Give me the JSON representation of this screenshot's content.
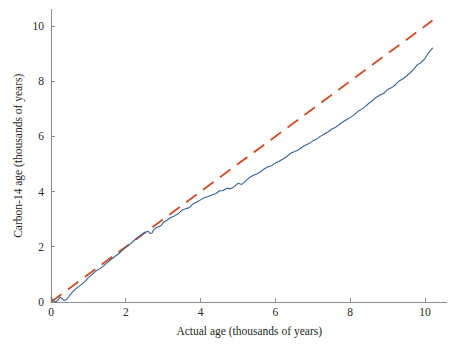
{
  "chart_data": {
    "type": "line",
    "title": "",
    "xlabel": "Actual age (thousands of years)",
    "ylabel": "Carbon-14 age (thousands of years)",
    "xlim": [
      0,
      10.6
    ],
    "ylim": [
      0,
      10.6
    ],
    "xticks": [
      0,
      2,
      4,
      6,
      8,
      10
    ],
    "yticks": [
      0,
      2,
      4,
      6,
      8,
      10
    ],
    "xtick_labels": [
      "0",
      "2",
      "4",
      "6",
      "8",
      "10"
    ],
    "ytick_labels": [
      "0",
      "2",
      "4",
      "6",
      "8",
      "10"
    ],
    "grid": false,
    "legend": "none",
    "series": [
      {
        "name": "One-to-one reference line",
        "style": "dashed",
        "color": "#d0502a",
        "linewidth": 1.9,
        "dash_pattern": "13,8",
        "x": [
          0,
          10.2
        ],
        "values": [
          0,
          10.2
        ]
      },
      {
        "name": "Carbon-14 calibration curve",
        "style": "solid",
        "color": "#36609a",
        "linewidth": 1.1,
        "x": [
          0,
          0.06,
          0.12,
          0.18,
          0.24,
          0.3,
          0.36,
          0.42,
          0.48,
          0.54,
          0.6,
          0.7,
          0.8,
          0.9,
          1.0,
          1.1,
          1.2,
          1.3,
          1.4,
          1.5,
          1.6,
          1.7,
          1.8,
          1.9,
          2.0,
          2.1,
          2.2,
          2.3,
          2.4,
          2.5,
          2.6,
          2.65,
          2.7,
          2.75,
          2.8,
          2.85,
          2.9,
          2.95,
          3.0,
          3.1,
          3.2,
          3.3,
          3.4,
          3.5,
          3.6,
          3.7,
          3.8,
          3.9,
          4.0,
          4.1,
          4.2,
          4.3,
          4.4,
          4.5,
          4.6,
          4.7,
          4.8,
          4.9,
          5.0,
          5.1,
          5.2,
          5.3,
          5.4,
          5.5,
          5.6,
          5.7,
          5.8,
          5.9,
          6.0,
          6.1,
          6.2,
          6.3,
          6.4,
          6.5,
          6.6,
          6.7,
          6.8,
          6.9,
          7.0,
          7.1,
          7.2,
          7.3,
          7.4,
          7.5,
          7.6,
          7.7,
          7.8,
          7.9,
          8.0,
          8.1,
          8.2,
          8.3,
          8.4,
          8.5,
          8.6,
          8.7,
          8.8,
          8.9,
          9.0,
          9.1,
          9.2,
          9.3,
          9.4,
          9.5,
          9.6,
          9.7,
          9.8,
          9.9,
          10.0,
          10.1,
          10.2
        ],
        "values": [
          0.16,
          0.05,
          0.0,
          0.06,
          0.18,
          0.12,
          0.05,
          0.1,
          0.2,
          0.3,
          0.4,
          0.52,
          0.62,
          0.74,
          0.88,
          1.0,
          1.12,
          1.2,
          1.3,
          1.42,
          1.54,
          1.64,
          1.74,
          1.86,
          1.98,
          2.08,
          2.2,
          2.32,
          2.42,
          2.52,
          2.56,
          2.48,
          2.5,
          2.62,
          2.68,
          2.72,
          2.74,
          2.78,
          2.88,
          2.96,
          3.06,
          3.12,
          3.2,
          3.32,
          3.38,
          3.42,
          3.56,
          3.62,
          3.7,
          3.78,
          3.82,
          3.88,
          3.92,
          4.02,
          4.04,
          4.12,
          4.1,
          4.18,
          4.3,
          4.26,
          4.38,
          4.5,
          4.58,
          4.64,
          4.72,
          4.82,
          4.9,
          4.94,
          5.04,
          5.1,
          5.18,
          5.26,
          5.38,
          5.44,
          5.5,
          5.6,
          5.68,
          5.74,
          5.84,
          5.9,
          6.0,
          6.08,
          6.16,
          6.26,
          6.32,
          6.42,
          6.52,
          6.6,
          6.68,
          6.78,
          6.9,
          6.98,
          7.08,
          7.2,
          7.3,
          7.42,
          7.5,
          7.56,
          7.7,
          7.76,
          7.86,
          8.0,
          8.08,
          8.18,
          8.3,
          8.44,
          8.6,
          8.68,
          8.82,
          9.04,
          9.2
        ]
      }
    ]
  }
}
